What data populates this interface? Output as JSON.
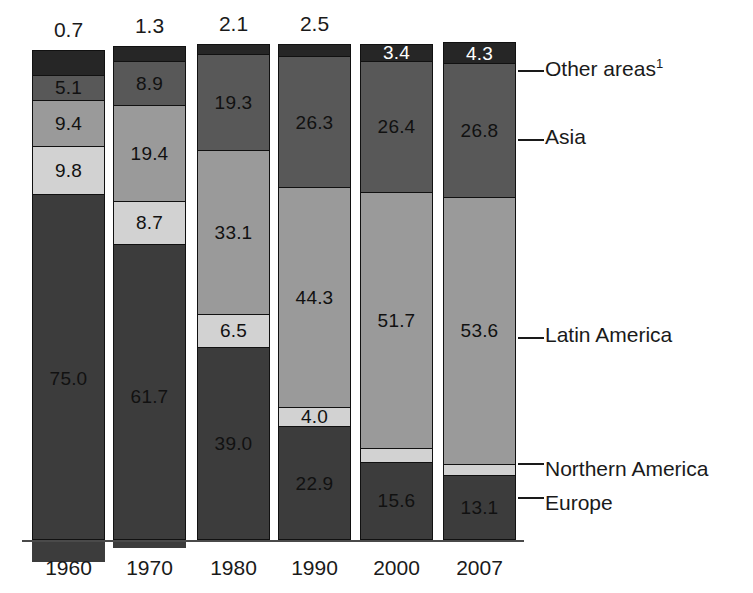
{
  "chart_data": {
    "type": "bar",
    "title": "",
    "subtitle": "",
    "xlabel": "",
    "ylabel": "",
    "ylim": [
      0,
      100
    ],
    "grid": false,
    "stacked": true,
    "units": "percent",
    "legend_position": "right",
    "categories": [
      "1960",
      "1970",
      "1980",
      "1990",
      "2000",
      "2007"
    ],
    "bar_totals": [
      "0.7",
      "1.3",
      "2.1",
      "2.5",
      "",
      ""
    ],
    "series": [
      {
        "name": "Other areas",
        "color": "#262626",
        "values": [
          5.1,
          3.0,
          2.1,
          2.5,
          3.4,
          4.3
        ]
      },
      {
        "name": "Asia",
        "color": "#585858",
        "values": [
          5.1,
          8.9,
          19.3,
          26.3,
          26.4,
          26.8
        ]
      },
      {
        "name": "Latin America",
        "color": "#9a9a9a",
        "values": [
          9.4,
          19.4,
          33.1,
          44.3,
          51.7,
          53.6
        ]
      },
      {
        "name": "Northern America",
        "color": "#d2d2d2",
        "values": [
          9.8,
          8.7,
          6.5,
          4.0,
          2.7,
          2.2
        ]
      },
      {
        "name": "Europe",
        "color": "#3c3c3c",
        "values": [
          75.0,
          61.7,
          39.0,
          22.9,
          15.6,
          13.1
        ]
      }
    ]
  },
  "bars": [
    {
      "year": "1960",
      "total": "0.7",
      "segments": [
        {
          "series": "Other areas",
          "label": "",
          "label_color": "#ffffff",
          "label_mode": "none"
        },
        {
          "series": "Asia",
          "label": "5.1",
          "label_color": "#111111",
          "label_mode": "inside"
        },
        {
          "series": "Latin America",
          "label": "9.4",
          "label_color": "#111111",
          "label_mode": "inside"
        },
        {
          "series": "Northern America",
          "label": "9.8",
          "label_color": "#111111",
          "label_mode": "inside"
        },
        {
          "series": "Europe",
          "label": "75.0",
          "label_color": "#111111",
          "label_mode": "inside"
        }
      ]
    },
    {
      "year": "1970",
      "total": "1.3",
      "segments": [
        {
          "series": "Other areas",
          "label": "",
          "label_color": "#ffffff",
          "label_mode": "none"
        },
        {
          "series": "Asia",
          "label": "8.9",
          "label_color": "#111111",
          "label_mode": "inside"
        },
        {
          "series": "Latin America",
          "label": "19.4",
          "label_color": "#111111",
          "label_mode": "inside"
        },
        {
          "series": "Northern America",
          "label": "8.7",
          "label_color": "#111111",
          "label_mode": "inside"
        },
        {
          "series": "Europe",
          "label": "61.7",
          "label_color": "#111111",
          "label_mode": "inside"
        }
      ]
    },
    {
      "year": "1980",
      "total": "2.1",
      "segments": [
        {
          "series": "Other areas",
          "label": "",
          "label_color": "#ffffff",
          "label_mode": "none"
        },
        {
          "series": "Asia",
          "label": "19.3",
          "label_color": "#111111",
          "label_mode": "inside"
        },
        {
          "series": "Latin America",
          "label": "33.1",
          "label_color": "#111111",
          "label_mode": "inside"
        },
        {
          "series": "Northern America",
          "label": "6.5",
          "label_color": "#111111",
          "label_mode": "inside"
        },
        {
          "series": "Europe",
          "label": "39.0",
          "label_color": "#111111",
          "label_mode": "inside"
        }
      ]
    },
    {
      "year": "1990",
      "total": "2.5",
      "segments": [
        {
          "series": "Other areas",
          "label": "",
          "label_color": "#ffffff",
          "label_mode": "none"
        },
        {
          "series": "Asia",
          "label": "26.3",
          "label_color": "#111111",
          "label_mode": "inside"
        },
        {
          "series": "Latin America",
          "label": "44.3",
          "label_color": "#111111",
          "label_mode": "inside"
        },
        {
          "series": "Northern America",
          "label": "4.0",
          "label_color": "#111111",
          "label_mode": "inside"
        },
        {
          "series": "Europe",
          "label": "22.9",
          "label_color": "#111111",
          "label_mode": "inside"
        }
      ]
    },
    {
      "year": "2000",
      "total": "",
      "segments": [
        {
          "series": "Other areas",
          "label": "3.4",
          "label_color": "#ffffff",
          "label_mode": "inside"
        },
        {
          "series": "Asia",
          "label": "26.4",
          "label_color": "#111111",
          "label_mode": "inside"
        },
        {
          "series": "Latin America",
          "label": "51.7",
          "label_color": "#111111",
          "label_mode": "inside"
        },
        {
          "series": "Northern America",
          "label": "2.7",
          "label_color": "#111111",
          "label_mode": "above"
        },
        {
          "series": "Europe",
          "label": "15.6",
          "label_color": "#111111",
          "label_mode": "inside"
        }
      ]
    },
    {
      "year": "2007",
      "total": "",
      "segments": [
        {
          "series": "Other areas",
          "label": "4.3",
          "label_color": "#ffffff",
          "label_mode": "inside"
        },
        {
          "series": "Asia",
          "label": "26.8",
          "label_color": "#111111",
          "label_mode": "inside"
        },
        {
          "series": "Latin America",
          "label": "53.6",
          "label_color": "#111111",
          "label_mode": "inside"
        },
        {
          "series": "Northern America",
          "label": "2.2",
          "label_color": "#111111",
          "label_mode": "above"
        },
        {
          "series": "Europe",
          "label": "13.1",
          "label_color": "#111111",
          "label_mode": "inside"
        }
      ]
    }
  ],
  "legend": [
    {
      "label": "Other areas",
      "footnote": "1"
    },
    {
      "label": "Asia",
      "footnote": ""
    },
    {
      "label": "Latin America",
      "footnote": ""
    },
    {
      "label": "Northern America",
      "footnote": ""
    },
    {
      "label": "Europe",
      "footnote": ""
    }
  ]
}
